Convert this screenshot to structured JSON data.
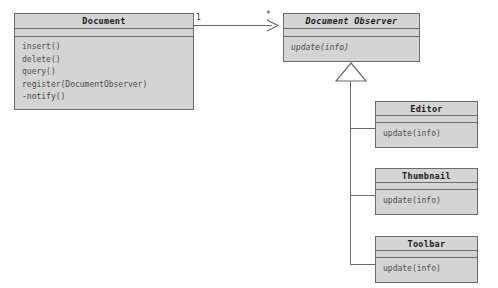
{
  "diagram": {
    "kind": "uml-class-diagram",
    "background_color": "#ffffff",
    "box_fill_color": "#d4d4d4",
    "line_color": "#6b6b6b",
    "text_color": "#4a4a4a"
  },
  "classes": {
    "document": {
      "name": "Document",
      "abstract": false,
      "operations": [
        "insert()",
        "delete()",
        "query()",
        "register(DocumentObserver)",
        "-notify()"
      ]
    },
    "observer": {
      "name": "Document Observer",
      "abstract": true,
      "operations": [
        "update(info)"
      ]
    },
    "editor": {
      "name": "Editor",
      "abstract": false,
      "operations": [
        "update(info)"
      ]
    },
    "thumbnail": {
      "name": "Thumbnail",
      "abstract": false,
      "operations": [
        "update(info)"
      ]
    },
    "toolbar": {
      "name": "Toolbar",
      "abstract": false,
      "operations": [
        "update(info)"
      ]
    }
  },
  "relationships": {
    "association": {
      "from": "Document",
      "to": "Document Observer",
      "source_multiplicity": "1",
      "target_multiplicity": "*",
      "arrow_style": "open-arrow"
    },
    "generalization": {
      "parent": "Document Observer",
      "children": [
        "Editor",
        "Thumbnail",
        "Toolbar"
      ],
      "arrow_style": "hollow-triangle"
    }
  }
}
